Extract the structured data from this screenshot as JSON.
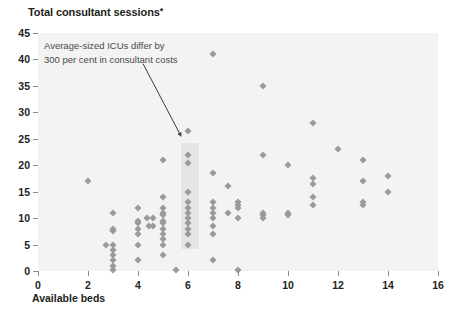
{
  "chart_data": {
    "type": "scatter",
    "title": "Total consultant sessions",
    "title_marker": "*",
    "xlabel": "Available beds",
    "ylabel": "",
    "xlim": [
      0,
      16
    ],
    "ylim": [
      0,
      45
    ],
    "xticks": [
      0,
      2,
      4,
      6,
      8,
      10,
      12,
      14,
      16
    ],
    "yticks": [
      0,
      5,
      10,
      15,
      20,
      25,
      30,
      35,
      40,
      45
    ],
    "xtick_labels": [
      "0",
      "2",
      "4",
      "6",
      "8",
      "10",
      "12",
      "14",
      "16"
    ],
    "ytick_labels": [
      "0",
      "5",
      "10",
      "15",
      "20",
      "25",
      "30",
      "35",
      "40",
      "45"
    ],
    "grid": false,
    "legend": "none",
    "marker_shape": "diamond",
    "marker_color": "#9a9a9a",
    "plot_background": "#f3f3f3",
    "annotations": [
      {
        "text_line1": "Average-sized ICUs differ by",
        "text_line2": "300 per cent in consultant costs",
        "arrow_from": [
          4.2,
          39.2
        ],
        "arrow_to": [
          5.72,
          25.5
        ]
      }
    ],
    "highlight_band": {
      "x_start": 5.7,
      "x_end": 6.45,
      "y_start": 4.2,
      "y_end": 24.2
    },
    "points": [
      [
        2.0,
        17.0
      ],
      [
        2.7,
        5.0
      ],
      [
        3.0,
        11.0
      ],
      [
        3.0,
        8.0
      ],
      [
        3.0,
        7.5
      ],
      [
        3.0,
        5.0
      ],
      [
        3.0,
        4.0
      ],
      [
        3.0,
        3.0
      ],
      [
        3.0,
        2.0
      ],
      [
        3.0,
        1.0
      ],
      [
        3.0,
        0.2
      ],
      [
        4.0,
        12.0
      ],
      [
        4.0,
        9.5
      ],
      [
        4.0,
        9.0
      ],
      [
        4.0,
        8.0
      ],
      [
        4.0,
        7.0
      ],
      [
        4.0,
        5.0
      ],
      [
        4.0,
        2.0
      ],
      [
        4.35,
        10.0
      ],
      [
        4.45,
        8.5
      ],
      [
        4.6,
        10.0
      ],
      [
        4.6,
        8.5
      ],
      [
        5.0,
        21.0
      ],
      [
        5.0,
        14.0
      ],
      [
        5.0,
        12.0
      ],
      [
        5.0,
        11.0
      ],
      [
        5.0,
        10.5
      ],
      [
        5.0,
        9.5
      ],
      [
        5.0,
        9.0
      ],
      [
        5.0,
        8.0
      ],
      [
        5.0,
        7.0
      ],
      [
        5.0,
        6.0
      ],
      [
        5.0,
        5.0
      ],
      [
        5.0,
        3.0
      ],
      [
        5.5,
        0.2
      ],
      [
        6.0,
        26.5
      ],
      [
        6.0,
        22.0
      ],
      [
        6.0,
        20.5
      ],
      [
        6.0,
        15.0
      ],
      [
        6.0,
        13.0
      ],
      [
        6.0,
        12.0
      ],
      [
        6.0,
        11.0
      ],
      [
        6.0,
        10.0
      ],
      [
        6.0,
        9.0
      ],
      [
        6.0,
        8.0
      ],
      [
        6.0,
        7.0
      ],
      [
        6.0,
        5.0
      ],
      [
        7.0,
        41.0
      ],
      [
        7.0,
        18.5
      ],
      [
        7.0,
        13.0
      ],
      [
        7.0,
        12.0
      ],
      [
        7.0,
        11.0
      ],
      [
        7.0,
        10.0
      ],
      [
        7.0,
        8.5
      ],
      [
        7.0,
        7.0
      ],
      [
        7.0,
        2.0
      ],
      [
        7.6,
        16.0
      ],
      [
        7.6,
        11.0
      ],
      [
        8.0,
        13.0
      ],
      [
        8.0,
        12.5
      ],
      [
        8.0,
        12.0
      ],
      [
        8.0,
        10.0
      ],
      [
        8.0,
        0.2
      ],
      [
        9.0,
        35.0
      ],
      [
        9.0,
        22.0
      ],
      [
        9.0,
        11.0
      ],
      [
        9.0,
        10.5
      ],
      [
        9.0,
        10.0
      ],
      [
        10.0,
        20.0
      ],
      [
        10.0,
        11.0
      ],
      [
        10.0,
        10.5
      ],
      [
        11.0,
        28.0
      ],
      [
        11.0,
        17.5
      ],
      [
        11.0,
        16.5
      ],
      [
        11.0,
        14.0
      ],
      [
        11.0,
        12.5
      ],
      [
        12.0,
        23.0
      ],
      [
        13.0,
        21.0
      ],
      [
        13.0,
        17.0
      ],
      [
        13.0,
        13.0
      ],
      [
        13.0,
        12.5
      ],
      [
        14.0,
        18.0
      ],
      [
        14.0,
        15.0
      ]
    ]
  }
}
